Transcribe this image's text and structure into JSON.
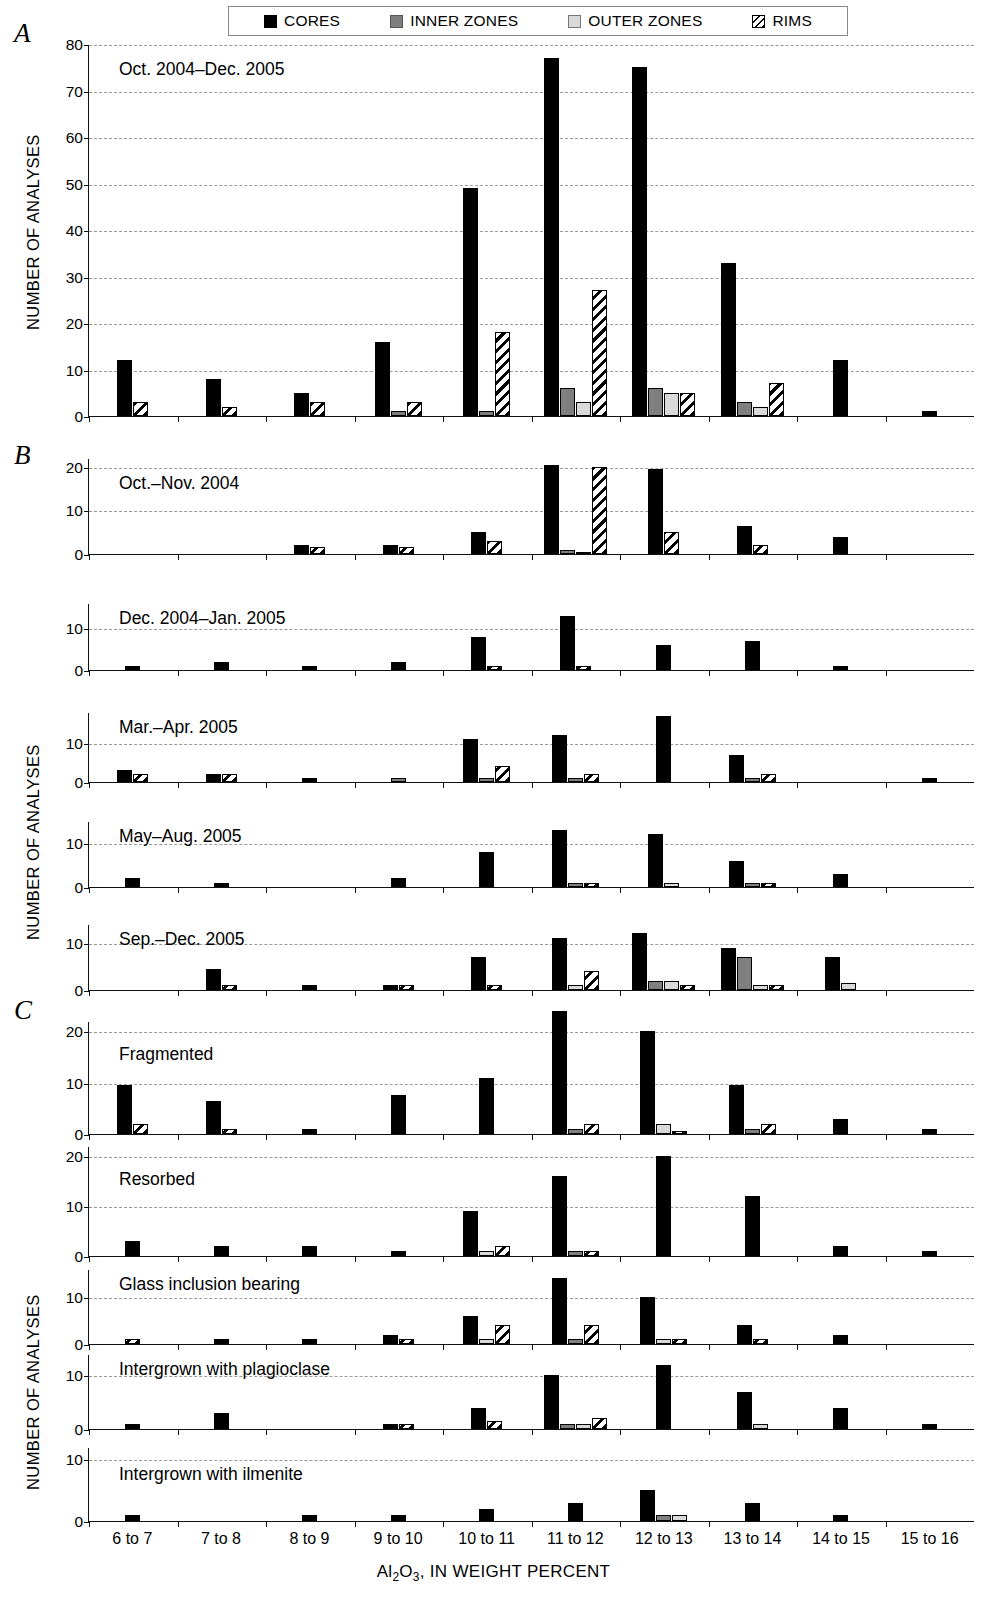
{
  "legend": {
    "items": [
      {
        "label": "CORES",
        "key": "cores",
        "color": "#000000"
      },
      {
        "label": "INNER ZONES",
        "key": "inner",
        "color": "#7f7f7f"
      },
      {
        "label": "OUTER ZONES",
        "key": "outer",
        "color": "#d9d9d9"
      },
      {
        "label": "RIMS",
        "key": "rims",
        "color": "#ffffff"
      }
    ]
  },
  "panels": [
    {
      "letter": "A"
    },
    {
      "letter": "B"
    },
    {
      "letter": "C"
    }
  ],
  "axis": {
    "y_title": "NUMBER OF ANALYSES",
    "x_title_html": "Al<sub>2</sub>O<sub>3</sub>, IN WEIGHT PERCENT",
    "x_title_text": "Al2O3, IN WEIGHT PERCENT",
    "categories": [
      "6 to 7",
      "7 to 8",
      "8 to 9",
      "9 to 10",
      "10 to 11",
      "11 to 12",
      "12 to 13",
      "13 to 14",
      "14 to 15",
      "15 to 16"
    ]
  },
  "chart_data": {
    "type": "bar",
    "xlabel": "Al2O3, IN WEIGHT PERCENT",
    "ylabel": "NUMBER OF ANALYSES",
    "grid": true,
    "legend_position": "top",
    "categories": [
      "6 to 7",
      "7 to 8",
      "8 to 9",
      "9 to 10",
      "10 to 11",
      "11 to 12",
      "12 to 13",
      "13 to 14",
      "14 to 15",
      "15 to 16"
    ],
    "series_names": [
      "CORES",
      "INNER ZONES",
      "OUTER ZONES",
      "RIMS"
    ],
    "subplots": [
      {
        "panel": "A",
        "title": "Oct. 2004–Dec. 2005",
        "ylim": [
          0,
          80
        ],
        "yticks": [
          0,
          10,
          20,
          30,
          40,
          50,
          60,
          70,
          80
        ],
        "series": [
          {
            "name": "CORES",
            "values": [
              12,
              8,
              5,
              16,
              49,
              77,
              75,
              33,
              12,
              1
            ]
          },
          {
            "name": "INNER ZONES",
            "values": [
              0,
              0,
              0,
              1,
              1,
              6,
              6,
              3,
              0,
              0
            ]
          },
          {
            "name": "OUTER ZONES",
            "values": [
              0,
              0,
              0,
              0,
              0,
              3,
              5,
              2,
              0,
              0
            ]
          },
          {
            "name": "RIMS",
            "values": [
              3,
              2,
              3,
              3,
              18,
              27,
              5,
              7,
              0,
              0
            ]
          }
        ]
      },
      {
        "panel": "B",
        "title": "Oct.–Nov. 2004",
        "ylim": [
          0,
          22
        ],
        "yticks": [
          0,
          10,
          20
        ],
        "series": [
          {
            "name": "CORES",
            "values": [
              0,
              0,
              2,
              2,
              5,
              20.5,
              19.5,
              6.5,
              4,
              0
            ]
          },
          {
            "name": "INNER ZONES",
            "values": [
              0,
              0,
              0,
              0,
              0,
              1,
              0,
              0,
              0,
              0
            ]
          },
          {
            "name": "OUTER ZONES",
            "values": [
              0,
              0,
              0,
              0,
              0,
              0.5,
              0,
              0,
              0,
              0
            ]
          },
          {
            "name": "RIMS",
            "values": [
              0,
              0,
              1.5,
              1.5,
              3,
              20,
              5,
              2,
              0,
              0
            ]
          }
        ]
      },
      {
        "panel": "B",
        "title": "Dec. 2004–Jan. 2005",
        "ylim": [
          0,
          16
        ],
        "yticks": [
          0,
          10
        ],
        "series": [
          {
            "name": "CORES",
            "values": [
              1,
              2,
              1,
              2,
              8,
              13,
              6,
              7,
              1,
              0
            ]
          },
          {
            "name": "INNER ZONES",
            "values": [
              0,
              0,
              0,
              0,
              0,
              0,
              0,
              0,
              0,
              0
            ]
          },
          {
            "name": "OUTER ZONES",
            "values": [
              0,
              0,
              0,
              0,
              0,
              0,
              0,
              0,
              0,
              0
            ]
          },
          {
            "name": "RIMS",
            "values": [
              0,
              0,
              0,
              0,
              1,
              1,
              0,
              0,
              0,
              0
            ]
          }
        ]
      },
      {
        "panel": "B",
        "title": "Mar.–Apr. 2005",
        "ylim": [
          0,
          18
        ],
        "yticks": [
          0,
          10
        ],
        "series": [
          {
            "name": "CORES",
            "values": [
              3,
              2,
              1,
              0,
              11,
              12,
              17,
              7,
              0,
              1
            ]
          },
          {
            "name": "INNER ZONES",
            "values": [
              0,
              0,
              0,
              1,
              1,
              1,
              0,
              1,
              0,
              0
            ]
          },
          {
            "name": "OUTER ZONES",
            "values": [
              0,
              0,
              0,
              0,
              0,
              0,
              0,
              0,
              0,
              0
            ]
          },
          {
            "name": "RIMS",
            "values": [
              2,
              2,
              0,
              0,
              4,
              2,
              0,
              2,
              0,
              0
            ]
          }
        ]
      },
      {
        "panel": "B",
        "title": "May–Aug. 2005",
        "ylim": [
          0,
          15
        ],
        "yticks": [
          0,
          10
        ],
        "series": [
          {
            "name": "CORES",
            "values": [
              2,
              1,
              0,
              2,
              8,
              13,
              12,
              6,
              3,
              0
            ]
          },
          {
            "name": "INNER ZONES",
            "values": [
              0,
              0,
              0,
              0,
              0,
              1,
              0,
              1,
              0,
              0
            ]
          },
          {
            "name": "OUTER ZONES",
            "values": [
              0,
              0,
              0,
              0,
              0,
              0,
              1,
              0,
              0,
              0
            ]
          },
          {
            "name": "RIMS",
            "values": [
              0,
              0,
              0,
              0,
              0,
              1,
              0,
              1,
              0,
              0
            ]
          }
        ]
      },
      {
        "panel": "B",
        "title": "Sep.–Dec. 2005",
        "ylim": [
          0,
          14
        ],
        "yticks": [
          0,
          10
        ],
        "series": [
          {
            "name": "CORES",
            "values": [
              0,
              4.5,
              1,
              1,
              7,
              11,
              12,
              9,
              7,
              0
            ]
          },
          {
            "name": "INNER ZONES",
            "values": [
              0,
              0,
              0,
              0,
              0,
              0,
              2,
              7,
              0,
              0
            ]
          },
          {
            "name": "OUTER ZONES",
            "values": [
              0,
              0,
              0,
              0,
              0,
              1,
              2,
              1,
              1.5,
              0
            ]
          },
          {
            "name": "RIMS",
            "values": [
              0,
              1,
              0,
              1,
              1,
              4,
              1,
              1,
              0,
              0
            ]
          }
        ]
      },
      {
        "panel": "C",
        "title": "Fragmented",
        "ylim": [
          0,
          22
        ],
        "yticks": [
          0,
          10,
          20
        ],
        "series": [
          {
            "name": "CORES",
            "values": [
              9.5,
              6.5,
              1,
              7.5,
              11,
              24,
              20,
              9.5,
              3,
              1
            ]
          },
          {
            "name": "INNER ZONES",
            "values": [
              0,
              0,
              0,
              0,
              0,
              1,
              0,
              1,
              0,
              0
            ]
          },
          {
            "name": "OUTER ZONES",
            "values": [
              0,
              0,
              0,
              0,
              0,
              0,
              2,
              0,
              0,
              0
            ]
          },
          {
            "name": "RIMS",
            "values": [
              2,
              1,
              0,
              0,
              0,
              2,
              0.5,
              2,
              0,
              0
            ]
          }
        ]
      },
      {
        "panel": "C",
        "title": "Resorbed",
        "ylim": [
          0,
          22
        ],
        "yticks": [
          0,
          10,
          20
        ],
        "series": [
          {
            "name": "CORES",
            "values": [
              3,
              2,
              2,
              1,
              9,
              16,
              20,
              12,
              2,
              1
            ]
          },
          {
            "name": "INNER ZONES",
            "values": [
              0,
              0,
              0,
              0,
              0,
              1,
              0,
              0,
              0,
              0
            ]
          },
          {
            "name": "OUTER ZONES",
            "values": [
              0,
              0,
              0,
              0,
              1,
              0,
              0,
              0,
              0,
              0
            ]
          },
          {
            "name": "RIMS",
            "values": [
              0,
              0,
              0,
              0,
              2,
              1,
              0,
              0,
              0,
              0
            ]
          }
        ]
      },
      {
        "panel": "C",
        "title": "Glass inclusion  bearing",
        "ylim": [
          0,
          16
        ],
        "yticks": [
          0,
          10
        ],
        "series": [
          {
            "name": "CORES",
            "values": [
              0,
              1,
              1,
              2,
              6,
              14,
              10,
              4,
              2,
              0
            ]
          },
          {
            "name": "INNER ZONES",
            "values": [
              0,
              0,
              0,
              0,
              0,
              1,
              0,
              0,
              0,
              0
            ]
          },
          {
            "name": "OUTER ZONES",
            "values": [
              0,
              0,
              0,
              0,
              1,
              0,
              1,
              0,
              0,
              0
            ]
          },
          {
            "name": "RIMS",
            "values": [
              1,
              0,
              0,
              1,
              4,
              4,
              1,
              1,
              0,
              0
            ]
          }
        ]
      },
      {
        "panel": "C",
        "title": "Intergrown with plagioclase",
        "ylim": [
          0,
          14
        ],
        "yticks": [
          0,
          10
        ],
        "series": [
          {
            "name": "CORES",
            "values": [
              1,
              3,
              0,
              1,
              4,
              10,
              12,
              7,
              4,
              1
            ]
          },
          {
            "name": "INNER ZONES",
            "values": [
              0,
              0,
              0,
              0,
              0,
              1,
              0,
              0,
              0,
              0
            ]
          },
          {
            "name": "OUTER ZONES",
            "values": [
              0,
              0,
              0,
              0,
              0,
              1,
              0,
              1,
              0,
              0
            ]
          },
          {
            "name": "RIMS",
            "values": [
              0,
              0,
              0,
              1,
              1.5,
              2,
              0,
              0,
              0,
              0
            ]
          }
        ]
      },
      {
        "panel": "C",
        "title": "Intergrown with ilmenite",
        "ylim": [
          0,
          12
        ],
        "yticks": [
          0,
          10
        ],
        "series": [
          {
            "name": "CORES",
            "values": [
              1,
              0,
              1,
              1,
              2,
              3,
              5,
              3,
              1,
              0
            ]
          },
          {
            "name": "INNER ZONES",
            "values": [
              0,
              0,
              0,
              0,
              0,
              0,
              1,
              0,
              0,
              0
            ]
          },
          {
            "name": "OUTER ZONES",
            "values": [
              0,
              0,
              0,
              0,
              0,
              0,
              1,
              0,
              0,
              0
            ]
          },
          {
            "name": "RIMS",
            "values": [
              0,
              0,
              0,
              0,
              0,
              0,
              0,
              0,
              0,
              0
            ]
          }
        ]
      }
    ]
  },
  "layout": {
    "subplot_geometry": [
      {
        "top": 45,
        "height": 372
      },
      {
        "top": 459,
        "height": 96
      },
      {
        "top": 604,
        "height": 67
      },
      {
        "top": 713,
        "height": 70
      },
      {
        "top": 822,
        "height": 66
      },
      {
        "top": 925,
        "height": 66
      },
      {
        "top": 1022,
        "height": 113
      },
      {
        "top": 1147,
        "height": 110
      },
      {
        "top": 1270,
        "height": 75
      },
      {
        "top": 1355,
        "height": 75
      },
      {
        "top": 1448,
        "height": 74
      }
    ],
    "panel_letters": [
      {
        "letter": "A",
        "left": 14,
        "top": 18
      },
      {
        "letter": "B",
        "left": 14,
        "top": 440
      },
      {
        "letter": "C",
        "left": 14,
        "top": 995
      }
    ],
    "ylabels": [
      {
        "left": 24,
        "top": 330
      },
      {
        "left": 24,
        "top": 940
      },
      {
        "left": 24,
        "top": 1490
      }
    ],
    "subtitle_positions": [
      {
        "left": 30,
        "top": 14
      },
      {
        "left": 30,
        "top": 14
      },
      {
        "left": 30,
        "top": 4
      },
      {
        "left": 30,
        "top": 4
      },
      {
        "left": 30,
        "top": 4
      },
      {
        "left": 30,
        "top": 4
      },
      {
        "left": 30,
        "top": 22
      },
      {
        "left": 30,
        "top": 22
      },
      {
        "left": 30,
        "top": 4
      },
      {
        "left": 30,
        "top": 4
      },
      {
        "left": 30,
        "top": 16
      }
    ]
  }
}
